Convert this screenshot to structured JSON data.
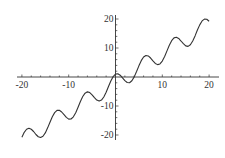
{
  "chart_data": {
    "type": "line",
    "title": "",
    "xlabel": "",
    "ylabel": "",
    "xlim": [
      -20,
      20
    ],
    "ylim": [
      -20,
      20
    ],
    "grid": false,
    "legend": null,
    "axes_style": "cross-at-origin",
    "x_ticks": [
      -20,
      -10,
      10,
      20
    ],
    "y_ticks": [
      -20,
      -10,
      10,
      20
    ],
    "x_tick_labels": [
      "-20",
      "-10",
      "10",
      "20"
    ],
    "y_tick_labels": [
      "-20",
      "-10",
      "10",
      "20"
    ],
    "line_color": "#333333",
    "axis_color": "#333333",
    "series": [
      {
        "name": "curve",
        "x": [
          -20,
          -19.5,
          -19,
          -18.5,
          -18,
          -17.5,
          -17,
          -16.5,
          -16,
          -15.5,
          -15,
          -14.5,
          -14,
          -13.5,
          -13,
          -12.5,
          -12,
          -11.5,
          -11,
          -10.5,
          -10,
          -9.5,
          -9,
          -8.5,
          -8,
          -7.5,
          -7,
          -6.5,
          -6,
          -5.5,
          -5,
          -4.5,
          -4,
          -3.5,
          -3,
          -2.5,
          -2,
          -1.5,
          -1,
          -0.5,
          0,
          0.5,
          1,
          1.5,
          2,
          2.5,
          3,
          3.5,
          4,
          4.5,
          5,
          5.5,
          6,
          6.5,
          7,
          7.5,
          8,
          8.5,
          9,
          9.5,
          10,
          10.5,
          11,
          11.5,
          12,
          12.5,
          13,
          13.5,
          14,
          14.5,
          15,
          15.5,
          16,
          16.5,
          17,
          17.5,
          18,
          18.5,
          19,
          19.5,
          20
        ],
        "y": [
          -20.78,
          -19.09,
          -18.03,
          -17.67,
          -18.02,
          -18.8,
          -19.83,
          -20.6,
          -20.87,
          -20.45,
          -19.28,
          -17.53,
          -15.59,
          -13.72,
          -12.28,
          -11.51,
          -11.47,
          -12.07,
          -12.99,
          -13.93,
          -14.52,
          -14.49,
          -13.73,
          -12.31,
          -10.44,
          -8.46,
          -6.74,
          -5.57,
          -5.12,
          -5.37,
          -6.15,
          -7.13,
          -7.96,
          -8.31,
          -7.97,
          -6.9,
          -5.25,
          -3.29,
          -1.38,
          0.13,
          1,
          1.13,
          0.62,
          -0.29,
          -1.25,
          -1.9,
          -1.97,
          -1.31,
          0.04,
          1.87,
          3.85,
          5.63,
          6.88,
          7.43,
          7.26,
          6.54,
          5.56,
          4.69,
          4.27,
          4.51,
          5.48,
          7.07,
          9.01,
          10.93,
          12.53,
          13.49,
          13.72,
          13.29,
          12.41,
          11.48,
          10.72,
          10.55,
          11.13,
          12.4,
          14.17,
          16.2,
          17.98,
          19.33,
          19.97,
          19.91,
          19.22
        ]
      }
    ]
  }
}
